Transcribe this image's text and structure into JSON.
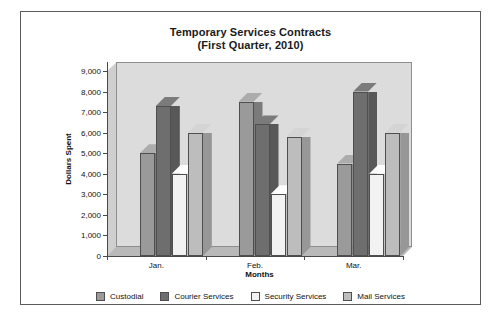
{
  "chart_data": {
    "type": "bar",
    "title": "Temporary Services Contracts",
    "subtitle": "(First Quarter, 2010)",
    "title_line1": "Temporary Services Contracts",
    "title_line2": "(First Quarter, 2010)",
    "xlabel": "Months",
    "ylabel": "Dollars Spent",
    "categories": [
      "Jan.",
      "Feb.",
      "Mar."
    ],
    "ylim": [
      0,
      9000
    ],
    "ytick_step": 1000,
    "ytick_labels": [
      "9,000",
      "8,000",
      "7,000",
      "6,000",
      "5,000",
      "4,000",
      "3,000",
      "2,000",
      "1,000",
      "0"
    ],
    "ytick_values": [
      9000,
      8000,
      7000,
      6000,
      5000,
      4000,
      3000,
      2000,
      1000,
      0
    ],
    "grid": false,
    "legend_position": "bottom",
    "three_d": true,
    "series": [
      {
        "name": "Custodial",
        "color": "#9a9a9a",
        "values": [
          5000,
          7500,
          4500
        ]
      },
      {
        "name": "Courier Services",
        "color": "#6e6e6e",
        "values": [
          7300,
          6400,
          8000
        ]
      },
      {
        "name": "Security Services",
        "color": "#f2f2f2",
        "values": [
          4000,
          3000,
          4000
        ]
      },
      {
        "name": "Mail Services",
        "color": "#bdbdbd",
        "values": [
          6000,
          5800,
          6000
        ]
      }
    ]
  },
  "colors": {
    "plot_background": "#dcdcdc",
    "frame_border": "#5b5b5b",
    "axis": "#4a4a4a",
    "text": "#111111"
  }
}
